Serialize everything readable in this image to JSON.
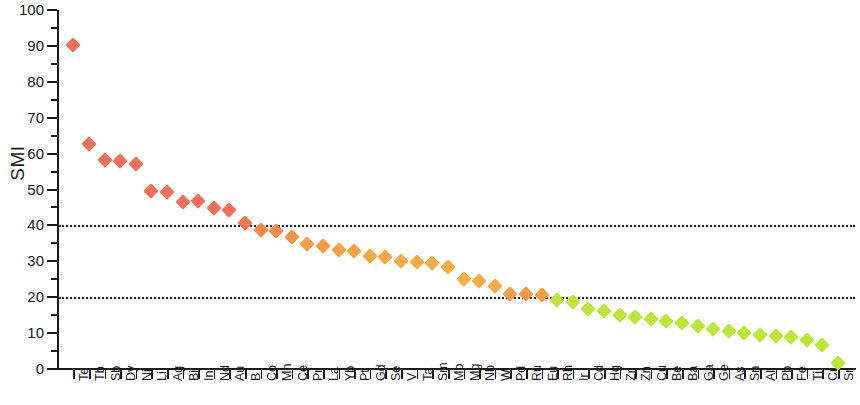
{
  "chart": {
    "type": "scatter",
    "title": "",
    "ylabel": "SMI",
    "xlabel": ""
  },
  "axes": {
    "y_ticks": [
      "0",
      "10",
      "20",
      "30",
      "40",
      "50",
      "60",
      "70",
      "80",
      "90",
      "100"
    ],
    "y_min": 0,
    "y_max": 100,
    "y_tick_step": 10,
    "y_minor_step": 5,
    "reference_lines": [
      20,
      40
    ]
  },
  "style": {
    "axis_color": "#1a1a1a",
    "reference_line_color": "#222222",
    "marker_color_high": "#F2705A",
    "marker_color_mid": "#F5A04A",
    "marker_color_low": "#BCEA3C",
    "background": "#ffffff"
  },
  "chart_data": {
    "type": "scatter",
    "title": "",
    "xlabel": "",
    "ylabel": "SMI",
    "ylim": [
      0,
      100
    ],
    "grid": false,
    "legend": null,
    "annotations": [
      {
        "type": "hline",
        "value": 40,
        "style": "dotted"
      },
      {
        "type": "hline",
        "value": 20,
        "style": "dotted"
      }
    ],
    "categories": [
      "Te",
      "Tb",
      "Sb",
      "Dy",
      "Ni",
      "Li",
      "Ag",
      "Bi",
      "In",
      "Nd",
      "Au",
      "B",
      "Co",
      "Mn",
      "Ce",
      "Pr",
      "La",
      "Yb",
      "Pt",
      "Gd",
      "Se",
      "V",
      "Ta",
      "Sm",
      "Mo",
      "Mg",
      "Nb",
      "W",
      "Pd",
      "Ru",
      "Eu",
      "Rh",
      "Ir",
      "Cd",
      "Hg",
      "Zr",
      "Zn",
      "Cu",
      "Be",
      "Ba",
      "Ga",
      "Ge",
      "As",
      "Sn",
      "Al",
      "Pb",
      "Fe",
      "Ti",
      "Cr",
      "Sr"
    ],
    "values": [
      90.2,
      62.8,
      58.2,
      58.0,
      57.0,
      49.6,
      49.4,
      46.5,
      46.8,
      44.8,
      44.2,
      40.6,
      38.8,
      38.4,
      36.8,
      34.8,
      34.2,
      33.2,
      33.0,
      31.4,
      31.2,
      30.0,
      29.8,
      29.6,
      28.4,
      25.2,
      24.6,
      23.2,
      21.0,
      20.8,
      20.6,
      19.2,
      18.6,
      16.8,
      16.2,
      15.0,
      14.4,
      13.8,
      13.4,
      12.8,
      12.0,
      11.2,
      10.6,
      10.0,
      9.4,
      9.2,
      8.8,
      8.0,
      6.8,
      1.6
    ],
    "point_colors": [
      "#F2705A",
      "#F2705A",
      "#F2705A",
      "#F2705A",
      "#F2705A",
      "#F2705A",
      "#F2705A",
      "#F2705A",
      "#F2705A",
      "#F2705A",
      "#F2705A",
      "#F47A4E",
      "#F58A4C",
      "#F58A4C",
      "#F5934A",
      "#F69B48",
      "#F69B48",
      "#F7A247",
      "#F7A247",
      "#F7A746",
      "#F7A746",
      "#F8AB46",
      "#F8AB46",
      "#F8AB46",
      "#F8AF45",
      "#F8B045",
      "#F8B045",
      "#F6AC46",
      "#F5A048",
      "#F4964A",
      "#F59E49",
      "#C8E03E",
      "#C2E23E",
      "#BFE33D",
      "#BFE33D",
      "#BDE43D",
      "#BCE53C",
      "#BCE53C",
      "#BCE53C",
      "#BCE53C",
      "#BCE53C",
      "#BCE53C",
      "#BCE53C",
      "#BCE53C",
      "#BCE53C",
      "#BCE53C",
      "#BCE53C",
      "#BCE53C",
      "#BCE53C",
      "#BCE53C"
    ]
  }
}
